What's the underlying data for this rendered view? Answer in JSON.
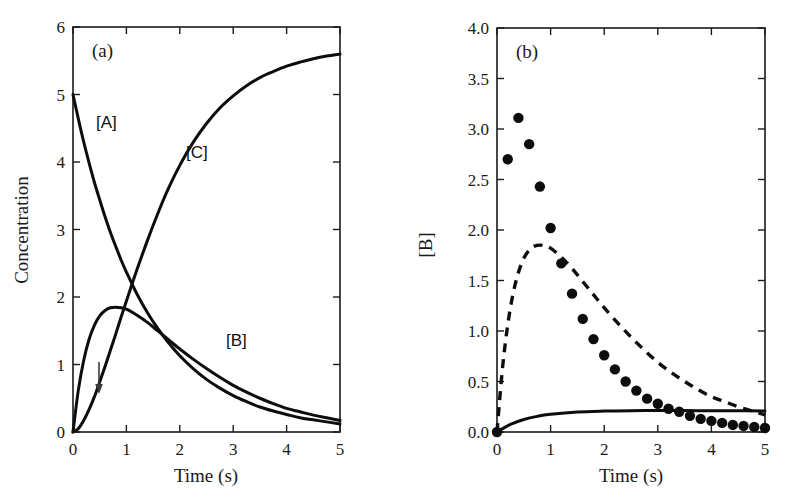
{
  "figure": {
    "background": "#ffffff",
    "ink": "#0d0d0d",
    "panel_a_label": "(a)",
    "panel_b_label": "(b)"
  },
  "panel_a": {
    "xlabel": "Time (s)",
    "ylabel": "Concentration",
    "xticks": [
      "0",
      "1",
      "2",
      "3",
      "4",
      "5"
    ],
    "yticks": [
      "0",
      "1",
      "2",
      "3",
      "4",
      "5",
      "6"
    ],
    "series_labels": {
      "a": "[A]",
      "b": "[B]",
      "c": "[C]"
    },
    "annotation_arrow": "down-arrow"
  },
  "panel_b": {
    "xlabel": "Time (s)",
    "ylabel": "[B]",
    "xticks": [
      "0",
      "1",
      "2",
      "3",
      "4",
      "5"
    ],
    "yticks": [
      "0.0",
      "0.5",
      "1.0",
      "1.5",
      "2.0",
      "2.5",
      "3.0",
      "3.5",
      "4.0"
    ]
  },
  "chart_data": [
    {
      "type": "line",
      "panel": "(a)",
      "title": "",
      "xlabel": "Time (s)",
      "ylabel": "Concentration",
      "xlim": [
        0,
        5
      ],
      "ylim": [
        0,
        6
      ],
      "xticks": [
        0,
        1,
        2,
        3,
        4,
        5
      ],
      "yticks": [
        0,
        1,
        2,
        3,
        4,
        5,
        6
      ],
      "grid": false,
      "legend": "inline-labels",
      "annotations": [
        {
          "text": "[A]",
          "x": 0.55,
          "y": 4.55
        },
        {
          "text": "[C]",
          "x": 2.05,
          "y": 4.2
        },
        {
          "text": "[B]",
          "x": 3.3,
          "y": 1.3
        },
        {
          "text": "down-arrow",
          "x": 0.4,
          "y": 0.85
        }
      ],
      "x": [
        0,
        0.1,
        0.2,
        0.3,
        0.4,
        0.5,
        0.6,
        0.7,
        0.8,
        0.9,
        1.0,
        1.2,
        1.4,
        1.6,
        1.8,
        2.0,
        2.25,
        2.5,
        2.75,
        3.0,
        3.25,
        3.5,
        3.75,
        4.0,
        4.25,
        4.5,
        4.75,
        5.0
      ],
      "series": [
        {
          "name": "[A]",
          "style": "solid",
          "values": [
            5.0,
            4.64,
            4.3,
            3.99,
            3.7,
            3.44,
            3.19,
            2.96,
            2.75,
            2.55,
            2.37,
            2.04,
            1.76,
            1.52,
            1.31,
            1.13,
            0.94,
            0.78,
            0.65,
            0.54,
            0.45,
            0.37,
            0.31,
            0.26,
            0.21,
            0.18,
            0.15,
            0.12
          ]
        },
        {
          "name": "[B]",
          "style": "solid",
          "values": [
            0.0,
            0.62,
            1.06,
            1.37,
            1.58,
            1.72,
            1.8,
            1.84,
            1.85,
            1.84,
            1.82,
            1.73,
            1.62,
            1.49,
            1.36,
            1.23,
            1.08,
            0.94,
            0.81,
            0.69,
            0.59,
            0.5,
            0.42,
            0.35,
            0.3,
            0.25,
            0.21,
            0.17
          ]
        },
        {
          "name": "[C]",
          "style": "solid",
          "values": [
            0.0,
            0.05,
            0.17,
            0.33,
            0.52,
            0.74,
            0.97,
            1.21,
            1.45,
            1.7,
            1.94,
            2.41,
            2.85,
            3.26,
            3.63,
            3.95,
            4.29,
            4.57,
            4.8,
            4.98,
            5.13,
            5.25,
            5.34,
            5.42,
            5.48,
            5.53,
            5.57,
            5.6
          ]
        }
      ]
    },
    {
      "type": "scatter+line",
      "panel": "(b)",
      "title": "",
      "xlabel": "Time (s)",
      "ylabel": "[B]",
      "xlim": [
        0,
        5
      ],
      "ylim": [
        0.0,
        4.0
      ],
      "xticks": [
        0,
        1,
        2,
        3,
        4,
        5
      ],
      "yticks": [
        0.0,
        0.5,
        1.0,
        1.5,
        2.0,
        2.5,
        3.0,
        3.5,
        4.0
      ],
      "grid": false,
      "legend": "none",
      "series": [
        {
          "name": "data-points",
          "style": "markers",
          "marker": "filled-circle",
          "x": [
            0.0,
            0.2,
            0.4,
            0.6,
            0.8,
            1.0,
            1.2,
            1.4,
            1.6,
            1.8,
            2.0,
            2.2,
            2.4,
            2.6,
            2.8,
            3.0,
            3.2,
            3.4,
            3.6,
            3.8,
            4.0,
            4.2,
            4.4,
            4.6,
            4.8,
            5.0
          ],
          "values": [
            0.0,
            2.7,
            3.11,
            2.85,
            2.43,
            2.02,
            1.67,
            1.37,
            1.12,
            0.92,
            0.76,
            0.62,
            0.5,
            0.41,
            0.33,
            0.28,
            0.23,
            0.2,
            0.16,
            0.13,
            0.11,
            0.09,
            0.07,
            0.06,
            0.05,
            0.04
          ]
        },
        {
          "name": "dashed-model",
          "style": "dashed",
          "x": [
            0.0,
            0.1,
            0.2,
            0.3,
            0.4,
            0.5,
            0.6,
            0.7,
            0.8,
            0.9,
            1.0,
            1.2,
            1.4,
            1.6,
            1.8,
            2.0,
            2.25,
            2.5,
            2.75,
            3.0,
            3.25,
            3.5,
            3.75,
            4.0,
            4.25,
            4.5,
            4.75,
            5.0
          ],
          "values": [
            0.0,
            0.62,
            1.06,
            1.37,
            1.58,
            1.72,
            1.8,
            1.84,
            1.85,
            1.84,
            1.82,
            1.73,
            1.62,
            1.49,
            1.36,
            1.23,
            1.08,
            0.94,
            0.81,
            0.69,
            0.59,
            0.5,
            0.42,
            0.35,
            0.3,
            0.25,
            0.21,
            0.17
          ]
        },
        {
          "name": "solid-steady-state",
          "style": "solid",
          "x": [
            0.0,
            0.25,
            0.5,
            0.75,
            1.0,
            1.5,
            2.0,
            2.5,
            3.0,
            3.5,
            4.0,
            4.5,
            5.0
          ],
          "values": [
            0.0,
            0.075,
            0.124,
            0.155,
            0.175,
            0.198,
            0.207,
            0.211,
            0.212,
            0.212,
            0.211,
            0.21,
            0.209
          ]
        }
      ]
    }
  ]
}
